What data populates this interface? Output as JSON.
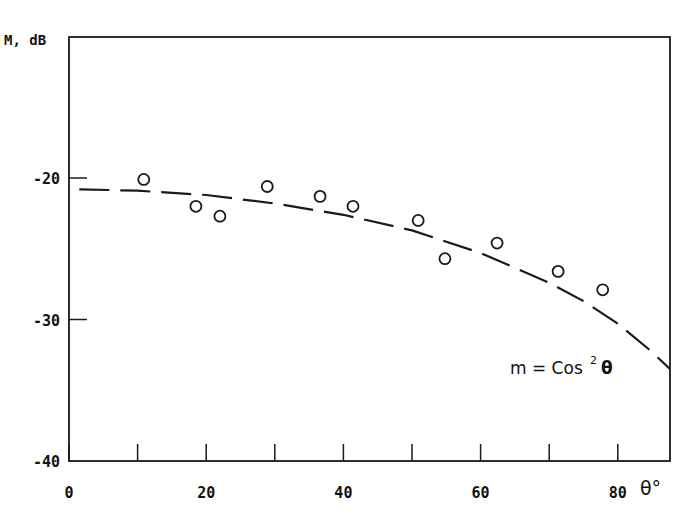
{
  "chart_data": {
    "type": "scatter",
    "title": "",
    "xlabel": "θ°",
    "ylabel": "M, dB",
    "xlim": [
      0,
      87.6
    ],
    "ylim": [
      -40,
      -10
    ],
    "x_ticks": [
      0,
      20,
      40,
      60,
      80
    ],
    "x_tick_labels": [
      "0",
      "20",
      "40",
      "60",
      "80"
    ],
    "x_minor_ticks": [
      10,
      30,
      50,
      70
    ],
    "y_ticks": [
      -20,
      -30,
      -40
    ],
    "y_tick_labels": [
      "-20",
      "-30",
      "-40"
    ],
    "grid": false,
    "legend": null,
    "annotations": [
      {
        "text_main": "m = Cos",
        "superscript": "2",
        "text_tail": "θ",
        "x": 71,
        "y": -31.5
      }
    ],
    "series": [
      {
        "name": "measured",
        "style": "open-circle",
        "x": [
          10.9,
          18.5,
          22.0,
          28.9,
          36.6,
          41.4,
          50.9,
          54.8,
          62.4,
          71.3,
          77.8
        ],
        "y": [
          -20.1,
          -22.0,
          -22.7,
          -20.6,
          -21.3,
          -22.0,
          -23.0,
          -25.7,
          -24.6,
          -26.6,
          -27.9
        ]
      },
      {
        "name": "m = Cos²θ",
        "style": "dashed-line",
        "x": [
          1.5,
          10,
          20,
          30,
          40,
          50,
          60,
          70,
          75,
          80,
          85,
          87.6
        ],
        "y": [
          -20.8,
          -20.9,
          -21.2,
          -21.8,
          -22.6,
          -23.7,
          -25.3,
          -27.4,
          -28.7,
          -30.3,
          -32.3,
          -33.5
        ]
      }
    ]
  },
  "labels": {
    "ylabel": "M, dB",
    "xlabel": "θ°",
    "annotation_main": "m = Cos",
    "annotation_sup": "2",
    "annotation_tail": "θ"
  }
}
